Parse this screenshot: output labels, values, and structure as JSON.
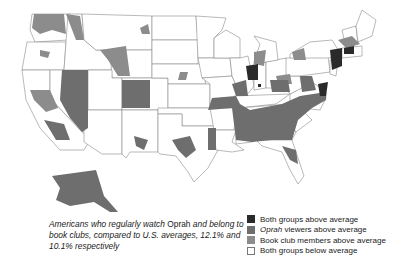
{
  "map": {
    "title": "Oprah viewers and book club membership by region",
    "colors": {
      "both_above": "#2a2a2a",
      "oprah_above": "#6e6e6e",
      "book_club_above": "#8c8c8c",
      "both_below": "#ffffff",
      "border": "#8a8a8a"
    }
  },
  "caption": {
    "part1": "Americans who regularly watch ",
    "oprah": "Oprah",
    "part2": " and belong to book clubs, compared to U.S. averages, 12.1% and 10.1% respectively"
  },
  "legend": {
    "items": [
      {
        "label_em": "",
        "label": "Both groups above average",
        "color": "#2a2a2a"
      },
      {
        "label_em": "Oprah",
        "label": " viewers above average",
        "color": "#6e6e6e"
      },
      {
        "label_em": "",
        "label": "Book club members above average",
        "color": "#8c8c8c"
      },
      {
        "label_em": "",
        "label": "Both groups below average",
        "color": "#ffffff"
      }
    ]
  }
}
